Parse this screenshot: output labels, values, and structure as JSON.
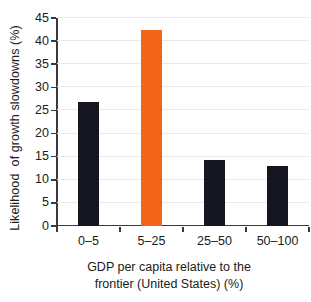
{
  "chart_data": {
    "type": "bar",
    "title": "",
    "subtitle": "",
    "categories": [
      "0–5",
      "5–25",
      "25–50",
      "50–100"
    ],
    "values": [
      26.8,
      42.4,
      14.2,
      12.9
    ],
    "series": [
      {
        "name": "Likelihood of growth slowdowns",
        "values": [
          26.8,
          42.4,
          14.2,
          12.9
        ]
      }
    ],
    "bar_colors": [
      "#15161f",
      "#f26419",
      "#15161f",
      "#15161f"
    ],
    "highlight_index": 1,
    "xlabel_line1": "GDP per capita relative to the",
    "xlabel_line2": "frontier (United States) (%)",
    "ylabel": "Likelihood  of growth slowdowns (%)",
    "ylim": [
      0,
      45
    ],
    "yticks": [
      0,
      5,
      10,
      15,
      20,
      25,
      30,
      35,
      40,
      45
    ],
    "ytick_labels": [
      "0",
      "5",
      "10",
      "15",
      "20",
      "25",
      "30",
      "35",
      "40",
      "45"
    ],
    "grid": true,
    "grid_axis": "y",
    "legend": false,
    "legend_position": "none",
    "annotations": []
  },
  "colors": {
    "bar_default": "#15161f",
    "bar_highlight": "#f26419",
    "gridline": "#e9e9ea",
    "axis": "#3a3a3a",
    "text": "#1b1b1b",
    "background": "#ffffff"
  }
}
